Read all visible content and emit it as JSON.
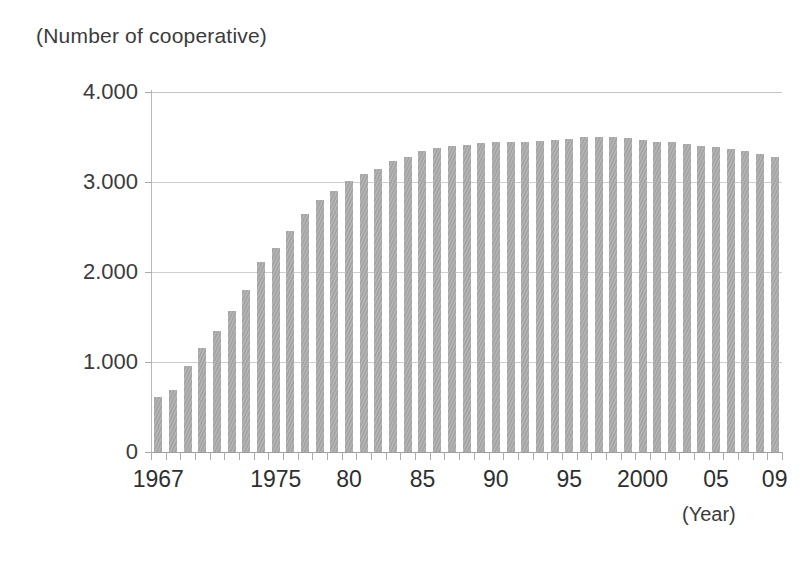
{
  "axes": {
    "y_unit_label": "(Number of cooperative)",
    "x_unit_label": "(Year)",
    "y_tick_labels": [
      "4.000",
      "3.000",
      "2.000",
      "1.000",
      "0"
    ],
    "x_tick_labels": [
      "1967",
      "1975",
      "80",
      "85",
      "90",
      "95",
      "2000",
      "05",
      "09"
    ]
  },
  "style": {
    "bar_color": "#a9a9a9",
    "gridline_color": "#cfcfcf",
    "axis_color": "#9e9e9e",
    "text_color": "#3b3b3b",
    "background": "#ffffff"
  },
  "caption_sliver": "",
  "chart_data": {
    "type": "bar",
    "title": "",
    "subtitle": "",
    "xlabel": "(Year)",
    "ylabel": "(Number of cooperative)",
    "ylim": [
      0,
      4000
    ],
    "yticks": [
      0,
      1000,
      2000,
      3000,
      4000
    ],
    "ytick_labels": [
      "0",
      "1.000",
      "2.000",
      "3.000",
      "4.000"
    ],
    "grid": true,
    "legend": false,
    "legend_position": "none",
    "categories": [
      "1967",
      "1968",
      "1969",
      "1970",
      "1971",
      "1972",
      "1973",
      "1974",
      "1975",
      "1976",
      "1977",
      "1978",
      "1979",
      "1980",
      "1981",
      "1982",
      "1983",
      "1984",
      "1985",
      "1986",
      "1987",
      "1988",
      "1989",
      "1990",
      "1991",
      "1992",
      "1993",
      "1994",
      "1995",
      "1996",
      "1997",
      "1998",
      "1999",
      "2000",
      "2001",
      "2002",
      "2003",
      "2004",
      "2005",
      "2006",
      "2007",
      "2008",
      "2009"
    ],
    "labelled_categories": [
      "1967",
      "1975",
      "80",
      "85",
      "90",
      "95",
      "2000",
      "05",
      "09"
    ],
    "values": [
      610,
      690,
      955,
      1160,
      1350,
      1570,
      1800,
      2110,
      2270,
      2460,
      2650,
      2800,
      2900,
      3010,
      3090,
      3150,
      3230,
      3280,
      3340,
      3380,
      3400,
      3410,
      3430,
      3440,
      3450,
      3450,
      3460,
      3470,
      3480,
      3500,
      3500,
      3500,
      3490,
      3470,
      3450,
      3440,
      3420,
      3400,
      3390,
      3370,
      3340,
      3310,
      3280
    ],
    "bar_color": "#a9a9a9",
    "annotations": []
  }
}
